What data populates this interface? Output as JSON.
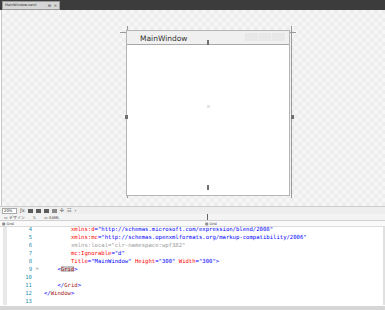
{
  "document_tab": {
    "label": "MainWindow.xaml",
    "pin_glyph": "⊞",
    "close_glyph": "✕"
  },
  "designer": {
    "window_title": "MainWindow",
    "window_width": "300",
    "window_height": "300"
  },
  "zoombar": {
    "zoom_level": "20%",
    "icons": [
      "grid-icon",
      "snap-grid-icon",
      "artboard-icon",
      "snap-lines-icon",
      "effects-icon",
      "rulers-icon"
    ],
    "glyph_fx": "ƒx",
    "more_glyph": "‹"
  },
  "view_tabs": {
    "design": "▭ デザイン",
    "swap": "⇅",
    "xaml": "▭ XAML"
  },
  "nav": {
    "left": "▤ Grid",
    "right": "▤ Grid"
  },
  "editor": {
    "lines": [
      {
        "num": "4",
        "segments": [
          {
            "t": "        ",
            "c": ""
          },
          {
            "t": "xmlns:d",
            "c": "c-attr"
          },
          {
            "t": "=",
            "c": "c-punct"
          },
          {
            "t": "\"http://schemas.microsoft.com/expression/blend/2008\"",
            "c": "c-str"
          }
        ]
      },
      {
        "num": "5",
        "segments": [
          {
            "t": "        ",
            "c": ""
          },
          {
            "t": "xmlns:mc",
            "c": "c-attr"
          },
          {
            "t": "=",
            "c": "c-punct"
          },
          {
            "t": "\"http://schemas.openxmlformats.org/markup-compatibility/2006\"",
            "c": "c-str"
          }
        ]
      },
      {
        "num": "6",
        "segments": [
          {
            "t": "        ",
            "c": ""
          },
          {
            "t": "xmlns:local=\"clr-namespace:wpf382\"",
            "c": "c-gray"
          }
        ]
      },
      {
        "num": "7",
        "segments": [
          {
            "t": "        ",
            "c": ""
          },
          {
            "t": "mc:Ignorable",
            "c": "c-attr"
          },
          {
            "t": "=",
            "c": "c-punct"
          },
          {
            "t": "\"d\"",
            "c": "c-str"
          }
        ]
      },
      {
        "num": "8",
        "segments": [
          {
            "t": "        ",
            "c": ""
          },
          {
            "t": "Title",
            "c": "c-attr"
          },
          {
            "t": "=",
            "c": "c-punct"
          },
          {
            "t": "\"MainWindow\"",
            "c": "c-str"
          },
          {
            "t": " Height",
            "c": "c-attr"
          },
          {
            "t": "=",
            "c": "c-punct"
          },
          {
            "t": "\"300\"",
            "c": "c-str"
          },
          {
            "t": " Width",
            "c": "c-attr"
          },
          {
            "t": "=",
            "c": "c-punct"
          },
          {
            "t": "\"300\"",
            "c": "c-str"
          },
          {
            "t": ">",
            "c": "c-punct"
          }
        ]
      },
      {
        "num": "9",
        "fold": "⊟",
        "segments": [
          {
            "t": "    ",
            "c": ""
          },
          {
            "t": "<",
            "c": "c-punct"
          },
          {
            "t": "Grid",
            "c": "c-tag hl"
          },
          {
            "t": ">",
            "c": "c-punct"
          }
        ]
      },
      {
        "num": "10",
        "segments": []
      },
      {
        "num": "11",
        "segments": [
          {
            "t": "    ",
            "c": ""
          },
          {
            "t": "</",
            "c": "c-punct"
          },
          {
            "t": "Grid",
            "c": "c-tag"
          },
          {
            "t": ">",
            "c": "c-punct"
          }
        ]
      },
      {
        "num": "12",
        "segments": [
          {
            "t": "</",
            "c": "c-punct"
          },
          {
            "t": "Window",
            "c": "c-tag"
          },
          {
            "t": ">",
            "c": "c-punct"
          }
        ]
      },
      {
        "num": "13",
        "segments": []
      }
    ]
  }
}
